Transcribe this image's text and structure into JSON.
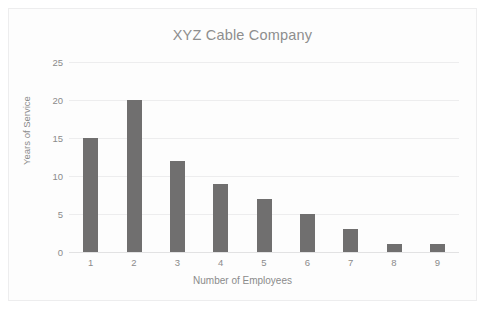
{
  "chart_data": {
    "type": "bar",
    "title": "XYZ Cable Company",
    "xlabel": "Number of Employees",
    "ylabel": "Years of Service",
    "categories": [
      "1",
      "2",
      "3",
      "4",
      "5",
      "6",
      "7",
      "8",
      "9"
    ],
    "values": [
      15,
      20,
      12,
      9,
      7,
      5,
      3,
      1,
      1
    ],
    "yticks": [
      0,
      5,
      10,
      15,
      20,
      25
    ],
    "ytick_labels": [
      "0",
      "5",
      "10",
      "15",
      "20",
      "25"
    ],
    "ylim": [
      0,
      25
    ],
    "grid": true,
    "legend": false,
    "legend_position": "none",
    "bar_color": "#706F6F",
    "grid_color": "#ededee",
    "text_color": "#8b8b8b",
    "title_color": "#8e8e8e",
    "background_color": "#fdfdfd",
    "border_color": "#ededee"
  }
}
